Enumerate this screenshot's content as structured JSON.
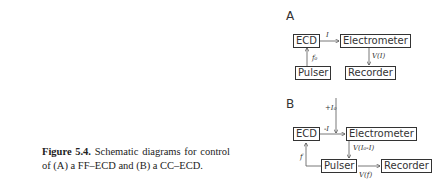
{
  "caption": {
    "figure_label": "Figure 5.4.",
    "text": "Schematic diagrams for control of (A) a FF–ECD and (B) a CC–ECD."
  },
  "diagram_a": {
    "label": "A",
    "boxes": {
      "ecd": "ECD",
      "electrometer": "Electrometer",
      "pulser": "Pulser",
      "recorder": "Recorder"
    },
    "edges": {
      "ecd_to_electrometer": "I",
      "pulser_to_ecd": "f₀",
      "electrometer_to_recorder": "V(I)"
    }
  },
  "diagram_b": {
    "label": "B",
    "boxes": {
      "ecd": "ECD",
      "electrometer": "Electrometer",
      "pulser": "Pulser",
      "recorder": "Recorder"
    },
    "edges": {
      "reference_current": "+I₀",
      "ecd_to_electrometer": "-I",
      "electrometer_to_pulser": "V(I₀-I)",
      "pulser_to_ecd": "f",
      "pulser_to_recorder": "V(f)"
    }
  }
}
